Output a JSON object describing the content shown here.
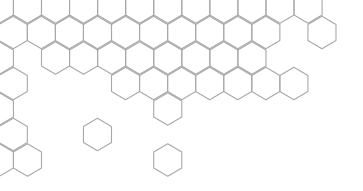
{
  "pattern": {
    "name": "hexagon-outline-pattern",
    "orientation": "pointy-top",
    "background_color": "#ffffff",
    "stroke_color": "#a8a8a8",
    "radius": 16.2,
    "col_width": 28.06,
    "row_height": 25.5,
    "origin_x_odd": 13.3,
    "origin_x_even": -0.6,
    "origin_y": 7,
    "rows": [
      {
        "row": 0,
        "cols": [
          0,
          1,
          2,
          3,
          4,
          5,
          6,
          7,
          8,
          9,
          10,
          11
        ]
      },
      {
        "row": 1,
        "cols": [
          0,
          1,
          2,
          3,
          4,
          5,
          6,
          7,
          8,
          9,
          11
        ]
      },
      {
        "row": 2,
        "cols": [
          0,
          2,
          3,
          4,
          5,
          6,
          7,
          8,
          9
        ]
      },
      {
        "row": 3,
        "cols": [
          0,
          4,
          5,
          6,
          7,
          8,
          9,
          10
        ]
      },
      {
        "row": 4,
        "cols": [
          0,
          6
        ]
      },
      {
        "row": 5,
        "cols": [
          0,
          3
        ]
      },
      {
        "row": 6,
        "cols": [
          0,
          1,
          6
        ]
      }
    ]
  }
}
